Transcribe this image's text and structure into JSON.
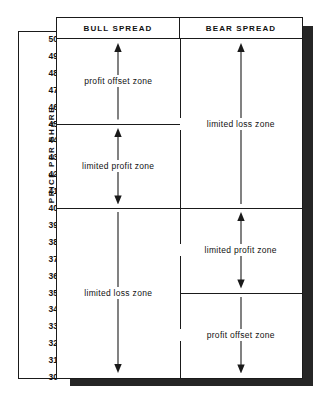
{
  "figure": {
    "axis": {
      "label": "PRICE PER SHARE",
      "ticks": [
        "50",
        "49",
        "48",
        "47",
        "46",
        "45",
        "44",
        "43",
        "42",
        "41",
        "40",
        "39",
        "38",
        "37",
        "36",
        "35",
        "34",
        "33",
        "32",
        "31",
        "30"
      ],
      "min": 30,
      "max": 50
    },
    "columns": [
      {
        "id": "bull",
        "header": "BULL SPREAD"
      },
      {
        "id": "bear",
        "header": "BEAR SPREAD"
      }
    ],
    "zones": [
      {
        "id": "bull-profit-offset",
        "column": "bull",
        "label": "profit offset zone",
        "from": 45,
        "to": 50,
        "arrow": "up"
      },
      {
        "id": "bull-limited-profit",
        "column": "bull",
        "label": "limited profit zone",
        "from": 40,
        "to": 45,
        "arrow": "both"
      },
      {
        "id": "bull-limited-loss",
        "column": "bull",
        "label": "limited loss zone",
        "from": 30,
        "to": 40,
        "arrow": "down"
      },
      {
        "id": "bear-limited-loss",
        "column": "bear",
        "label": "limited loss zone",
        "from": 40,
        "to": 50,
        "arrow": "up"
      },
      {
        "id": "bear-limited-profit",
        "column": "bear",
        "label": "limited profit zone",
        "from": 35,
        "to": 40,
        "arrow": "both"
      },
      {
        "id": "bear-profit-offset",
        "column": "bear",
        "label": "profit offset zone",
        "from": 30,
        "to": 35,
        "arrow": "down"
      }
    ],
    "colors": {
      "ink": "#1a1a1a",
      "paper": "#ffffff",
      "shadow": "#262626"
    }
  },
  "chart_data": {
    "type": "table",
    "ylabel": "PRICE PER SHARE",
    "ylim": [
      30,
      50
    ],
    "yticks": [
      30,
      31,
      32,
      33,
      34,
      35,
      36,
      37,
      38,
      39,
      40,
      41,
      42,
      43,
      44,
      45,
      46,
      47,
      48,
      49,
      50
    ],
    "grid": false,
    "legend": "none",
    "categories": [
      "BULL SPREAD",
      "BEAR SPREAD"
    ],
    "series": [
      {
        "name": "BULL SPREAD",
        "bands": [
          {
            "label": "profit offset zone",
            "range": [
              45,
              50
            ],
            "arrow": "up"
          },
          {
            "label": "limited profit zone",
            "range": [
              40,
              45
            ],
            "arrow": "both"
          },
          {
            "label": "limited loss zone",
            "range": [
              30,
              40
            ],
            "arrow": "down"
          }
        ]
      },
      {
        "name": "BEAR SPREAD",
        "bands": [
          {
            "label": "limited loss zone",
            "range": [
              40,
              50
            ],
            "arrow": "up"
          },
          {
            "label": "limited profit zone",
            "range": [
              35,
              40
            ],
            "arrow": "both"
          },
          {
            "label": "profit offset zone",
            "range": [
              30,
              35
            ],
            "arrow": "down"
          }
        ]
      }
    ]
  }
}
